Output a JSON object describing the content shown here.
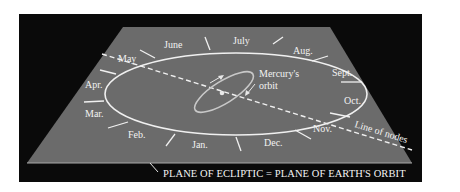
{
  "colors": {
    "background": "#ffffff",
    "frame": "#0a0a0a",
    "plane": "#6b6b6b",
    "plane_edge": "#9a9a9a",
    "orbit_line": "#f0f0f0",
    "mercury_orbit": "#c8c8c8",
    "sun": "#e8e8e8",
    "text": "#f2f2f2"
  },
  "months": [
    {
      "label": "May"
    },
    {
      "label": "June"
    },
    {
      "label": "July"
    },
    {
      "label": "Aug."
    },
    {
      "label": "Sept."
    },
    {
      "label": "Oct."
    },
    {
      "label": "Nov."
    },
    {
      "label": "Dec."
    },
    {
      "label": "Jan."
    },
    {
      "label": "Feb."
    },
    {
      "label": "Mar."
    },
    {
      "label": "Apr."
    }
  ],
  "labels": {
    "mercury_orbit_line1": "Mercury's",
    "mercury_orbit_line2": "orbit",
    "line_of_nodes": "Line of nodes",
    "caption": "PLANE OF ECLIPTIC = PLANE OF EARTH'S ORBIT"
  }
}
